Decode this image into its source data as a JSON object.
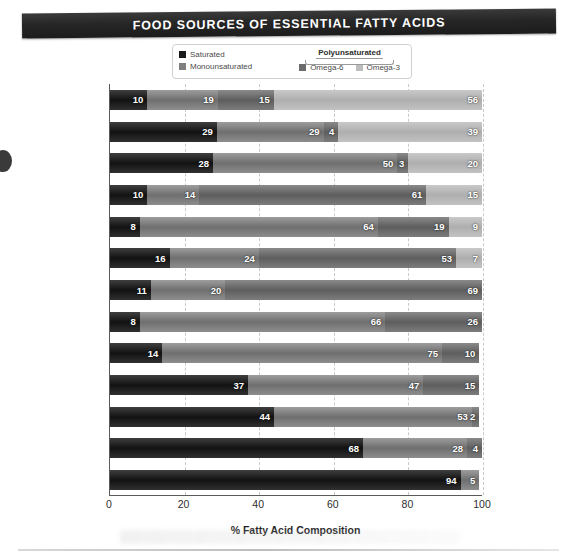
{
  "title": "FOOD SOURCES OF ESSENTIAL FATTY ACIDS",
  "legend": {
    "saturated": "Saturated",
    "monounsaturated": "Monounsaturated",
    "polyunsaturated": "Polyunsaturated",
    "omega6": "Omega-6",
    "omega3": "Omega-3",
    "colors": {
      "saturated": "#1a1a1a",
      "monounsaturated": "#7f7f7f",
      "omega6": "#6b6b6b",
      "omega3": "#bdbdbd"
    }
  },
  "chart_data": {
    "type": "bar",
    "orientation": "horizontal",
    "stacked": true,
    "title": "FOOD SOURCES OF ESSENTIAL FATTY ACIDS",
    "xlabel": "% Fatty Acid Composition",
    "ylabel": "",
    "xlim": [
      0,
      100
    ],
    "xticks": [
      0,
      20,
      40,
      60,
      80,
      100
    ],
    "xticklabels": [
      "0",
      "20",
      "40",
      "60",
      "80",
      "100"
    ],
    "grid": true,
    "grid_axis": "x",
    "legend_position": "top",
    "categories": [
      "Flaxseed oil",
      "Tuna (Albacore)",
      "Salmon (Chinook)",
      "Walnuts",
      "Canola oil",
      "Soybean oil",
      "Sunflower oil",
      "Almonds",
      "Olive oil",
      "Eggs",
      "Ground beef",
      "Butter",
      "Coconut"
    ],
    "series": [
      {
        "name": "Saturated",
        "color": "#1a1a1a",
        "values": [
          10,
          29,
          28,
          10,
          8,
          16,
          11,
          8,
          14,
          37,
          44,
          68,
          94
        ]
      },
      {
        "name": "Monounsaturated",
        "color": "#7f7f7f",
        "values": [
          19,
          29,
          50,
          14,
          64,
          24,
          20,
          66,
          75,
          47,
          53,
          28,
          5
        ]
      },
      {
        "name": "Omega-6",
        "color": "#6b6b6b",
        "values": [
          15,
          4,
          3,
          61,
          19,
          53,
          69,
          26,
          10,
          15,
          2,
          4,
          0
        ]
      },
      {
        "name": "Omega-3",
        "color": "#bdbdbd",
        "values": [
          56,
          39,
          20,
          15,
          9,
          7,
          0,
          0,
          0,
          0,
          0,
          0,
          0
        ]
      }
    ],
    "rows": [
      {
        "category": "Flaxseed oil",
        "saturated": 10,
        "monounsaturated": 19,
        "omega6": 15,
        "omega3": 56
      },
      {
        "category": "Tuna (Albacore)",
        "saturated": 29,
        "monounsaturated": 29,
        "omega6": 4,
        "omega3": 39
      },
      {
        "category": "Salmon (Chinook)",
        "saturated": 28,
        "monounsaturated": 50,
        "omega6": 3,
        "omega3": 20
      },
      {
        "category": "Walnuts",
        "saturated": 10,
        "monounsaturated": 14,
        "omega6": 61,
        "omega3": 15
      },
      {
        "category": "Canola oil",
        "saturated": 8,
        "monounsaturated": 64,
        "omega6": 19,
        "omega3": 9
      },
      {
        "category": "Soybean oil",
        "saturated": 16,
        "monounsaturated": 24,
        "omega6": 53,
        "omega3": 7
      },
      {
        "category": "Sunflower oil",
        "saturated": 11,
        "monounsaturated": 20,
        "omega6": 69,
        "omega3": 0
      },
      {
        "category": "Almonds",
        "saturated": 8,
        "monounsaturated": 66,
        "omega6": 26,
        "omega3": 0
      },
      {
        "category": "Olive oil",
        "saturated": 14,
        "monounsaturated": 75,
        "omega6": 10,
        "omega3": 0
      },
      {
        "category": "Eggs",
        "saturated": 37,
        "monounsaturated": 47,
        "omega6": 15,
        "omega3": 0
      },
      {
        "category": "Ground beef",
        "saturated": 44,
        "monounsaturated": 53,
        "omega6": 2,
        "omega3": 0
      },
      {
        "category": "Butter",
        "saturated": 68,
        "monounsaturated": 28,
        "omega6": 4,
        "omega3": 0
      },
      {
        "category": "Coconut",
        "saturated": 94,
        "monounsaturated": 5,
        "omega6": 0,
        "omega3": 0
      }
    ]
  }
}
